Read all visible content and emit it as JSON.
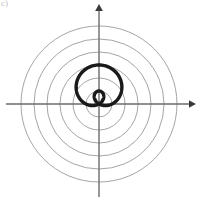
{
  "figure": {
    "label": "c)",
    "width": 198,
    "height": 203,
    "background_color": "#ffffff"
  },
  "colors": {
    "grid_circle": "#9a9a9a",
    "axis": "#6b6b6b",
    "curve": "#1a1a1a",
    "label": "#bfbfbf"
  },
  "axes": {
    "origin_x": 99,
    "origin_y": 104,
    "x_axis": {
      "name": "horizontal-axis",
      "from_x": 6,
      "to_x": 192,
      "arrow": "right"
    },
    "y_axis": {
      "name": "vertical-axis",
      "from_y": 197,
      "to_y": 8,
      "arrow": "up"
    },
    "arrow_size": 7,
    "stroke_width": 1.4
  },
  "polar_grid": {
    "type": "concentric-circles",
    "center": [
      99,
      104
    ],
    "radii": [
      13,
      26,
      39,
      52,
      65,
      78
    ],
    "stroke_width": 0.9,
    "count": 6
  },
  "chart_data": {
    "type": "line",
    "title": "",
    "subtitle": "",
    "xlabel": "",
    "ylabel": "",
    "coordinate_system": "polar",
    "grid": true,
    "legend": false,
    "axis_arrows": true,
    "xlim": [
      -7.6,
      7.6
    ],
    "ylim": [
      -8.0,
      7.6
    ],
    "grid_radii": [
      1,
      2,
      3,
      4,
      5,
      6
    ],
    "curve": {
      "name": "limacon-with-inner-loop",
      "equation": "r = 1 + 2*sin(theta)",
      "a": 1,
      "b": 2,
      "orientation": "vertical",
      "theta_range_deg": [
        0,
        360
      ],
      "theta_step_deg": 2,
      "scale_px_per_unit": 13,
      "stroke_width": 3.4,
      "features": {
        "max_radius": 3,
        "inner_loop": true,
        "inner_loop_radius": 1,
        "top_extent_units": 3,
        "bottom_extent_units": -1,
        "right_extent_units": 1.3,
        "left_extent_units": -1.3
      }
    }
  }
}
